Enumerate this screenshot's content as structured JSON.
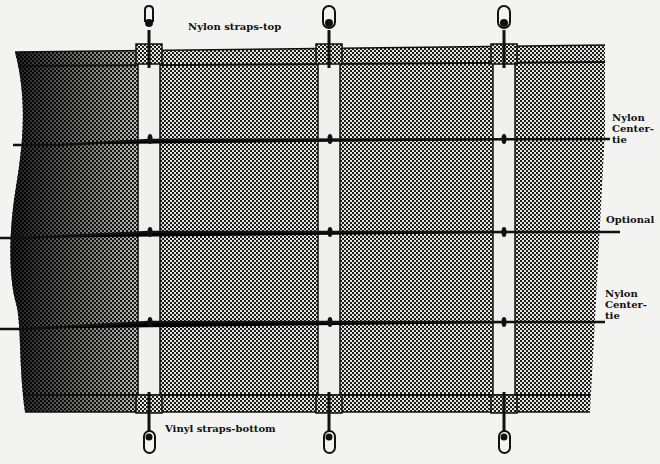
{
  "labels": {
    "straps_top": "Nylon straps-top",
    "center_tie_upper": "Nylon\nCenter-\ntie",
    "optional": "Optional",
    "center_tie_lower": "Nylon\nCenter-\ntie",
    "straps_bottom": "Vinyl straps-bottom"
  },
  "components": {
    "vertical_straps": 3,
    "horizontal_ties": [
      "Nylon Center-tie",
      "Optional",
      "Nylon Center-tie"
    ],
    "top_hooks": 3,
    "bottom_hooks": 3
  },
  "colors": {
    "background": "#f3f3f1",
    "ink": "#111111",
    "mesh_dark": "#1a1a1a",
    "mesh_light": "#e6e6e6",
    "strap_fill": "#efefed"
  }
}
